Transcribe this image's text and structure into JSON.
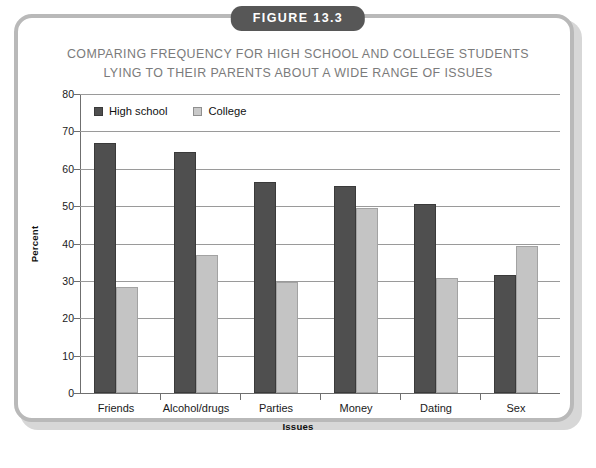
{
  "figure": {
    "badge_label": "FIGURE 13.3",
    "title_line1": "COMPARING FREQUENCY FOR HIGH SCHOOL AND COLLEGE STUDENTS",
    "title_line2": "LYING TO THEIR PARENTS ABOUT A WIDE RANGE OF ISSUES"
  },
  "colors": {
    "high_school_bar": "#4f4f4f",
    "college_bar": "#c4c4c4",
    "badge_background": "#575757",
    "title_text": "#7b7b7b",
    "frame_border": "#b9b9b9",
    "gridline": "#9a9a9a"
  },
  "legend": {
    "items": [
      {
        "label": "High school",
        "swatch": "dark-gray"
      },
      {
        "label": "College",
        "swatch": "light-gray"
      }
    ]
  },
  "axes": {
    "y_ticks": [
      "80",
      "70",
      "60",
      "50",
      "40",
      "30",
      "20",
      "10",
      "0"
    ],
    "y_title": "Percent",
    "x_title": "Issues"
  },
  "chart_data": {
    "type": "bar",
    "title": "COMPARING FREQUENCY FOR HIGH SCHOOL AND COLLEGE STUDENTS LYING TO THEIR PARENTS ABOUT A WIDE RANGE OF ISSUES",
    "xlabel": "Issues",
    "ylabel": "Percent",
    "ylim": [
      0,
      80
    ],
    "ytick_step": 10,
    "grid": true,
    "legend_position": "top-left inside plot",
    "categories": [
      "Friends",
      "Alcohol/drugs",
      "Parties",
      "Money",
      "Dating",
      "Sex"
    ],
    "series": [
      {
        "name": "High school",
        "color": "#4f4f4f",
        "values": [
          66.8,
          64.6,
          56.5,
          55.4,
          50.5,
          31.5
        ]
      },
      {
        "name": "College",
        "color": "#c4c4c4",
        "values": [
          28.3,
          36.8,
          29.7,
          49.6,
          30.7,
          39.4
        ]
      }
    ]
  },
  "caption": {
    "source_sliver": ""
  }
}
